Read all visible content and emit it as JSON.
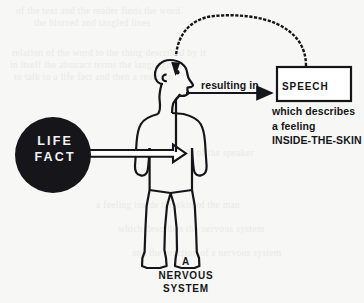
{
  "page": {
    "background_color": "#f7f7f6",
    "ink_color": "#16161a",
    "paper_note": "scanned book page with faint bleed-through text"
  },
  "diagram": {
    "node_life_fact": {
      "line1": "LIFE",
      "line2": "FACT",
      "shape": "filled-circle",
      "fill": "#16161a",
      "text_color": "#f4f4f2"
    },
    "node_speech": {
      "label": "SPEECH",
      "shape": "rectangle",
      "border_color": "#16161a",
      "fill": "#ffffff"
    },
    "arrow_resulting_in": {
      "label": "resulting in",
      "style": "solid-filled-arrow",
      "from": "mouth",
      "to": "speech-box"
    },
    "arrow_life_fact": {
      "style": "hollow-outline-arrow",
      "from": "life-fact-circle",
      "to": "body"
    },
    "arc_feedback": {
      "style": "stippled-curve-with-arrowhead",
      "from": "speech-box-top",
      "to": "head-top"
    },
    "description": {
      "line1": "which describes",
      "line2": "a feeling",
      "line3": "INSIDE-THE-SKIN"
    },
    "caption": {
      "line1": "A",
      "line2": "NERVOUS",
      "line3": "SYSTEM"
    },
    "figure": {
      "name": "human-figure-outline",
      "facing": "right",
      "features": [
        "ear",
        "eye",
        "nose",
        "open-mouth"
      ]
    }
  },
  "bleed_text": {
    "note": "illegible reverse-side show-through",
    "lines": [
      "of the text and the reader finds the word",
      "the blurred and tangled lines",
      "relation of the word to the thing described by it",
      "in itself the abstract terms the language of",
      "to talk to a life fact and then a reaction",
      "the reader to the words of the speaker",
      "a feeling inside the skin of the man",
      "which describes the nervous system",
      "and the reaction of a nervous system"
    ]
  }
}
